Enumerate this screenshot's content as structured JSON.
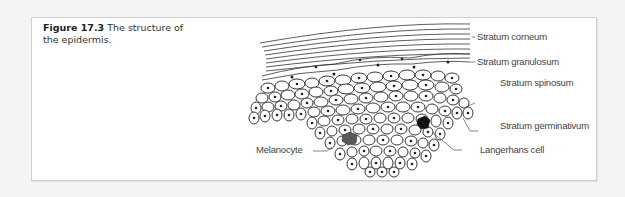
{
  "figure": {
    "number": "Figure 17.3",
    "caption": "The structure of the epidermis."
  },
  "labels": {
    "corneum": "Stratum corneum",
    "granulosum": "Stratum granulosum",
    "spinosum": "Stratum spinosum",
    "germinativum": "Stratum germinativum",
    "melanocyte": "Melanocyte",
    "langerhans": "Langerhans cell"
  },
  "colors": {
    "melanocyte": "#5a5a5a",
    "langerhans": "#111111",
    "line": "#222222"
  }
}
